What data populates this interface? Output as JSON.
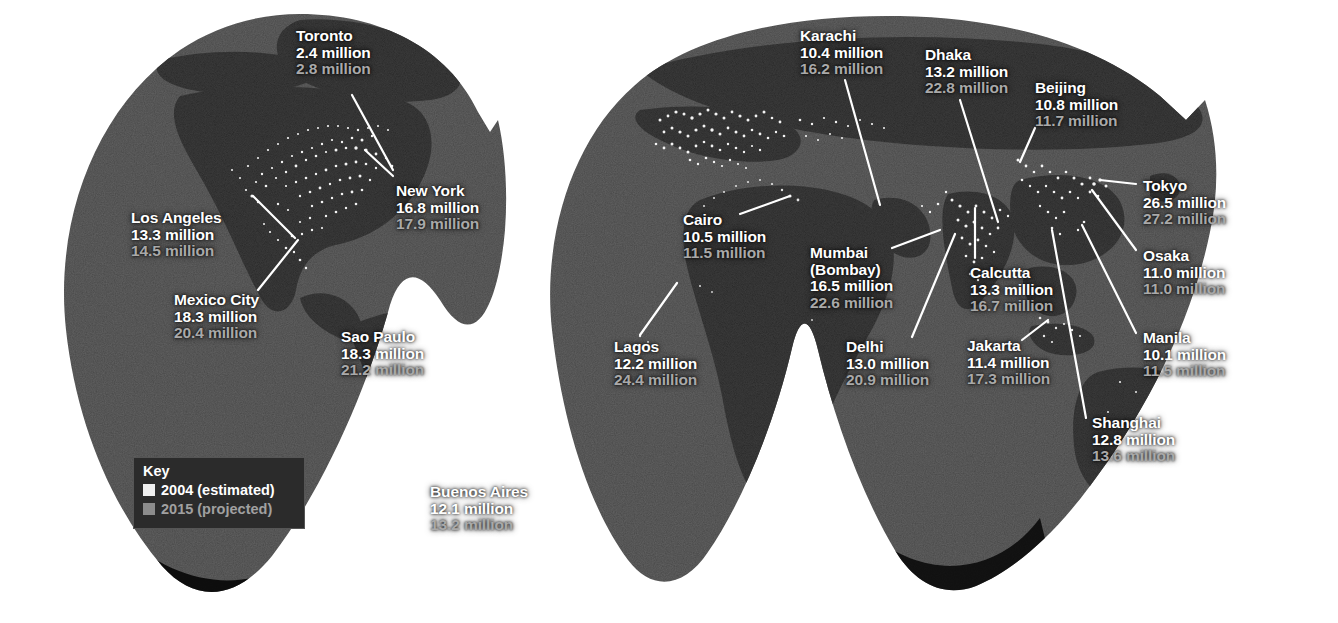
{
  "map": {
    "title": "World megacities night-lights map",
    "projection": "interrupted Goode homolosine",
    "ocean_color": "#262626",
    "land_color": "#0d0d0d",
    "light_color": "#ffffff",
    "background_color": "#ffffff",
    "leader_line_color": "#ffffff"
  },
  "key": {
    "title": "Key",
    "items": [
      {
        "label": "2004 (estimated)",
        "color": "#efefef",
        "text_color": "#ffffff"
      },
      {
        "label": "2015 (projected)",
        "color": "#8c8c8c",
        "text_color": "#a0a0a0"
      }
    ]
  },
  "units": "million",
  "chart_data": {
    "type": "map",
    "value_unit": "million",
    "series": [
      {
        "name": "2004 (estimated)",
        "color": "#ffffff"
      },
      {
        "name": "2015 (projected)",
        "color": "#a9a9a9"
      }
    ],
    "categories": [
      "Toronto",
      "New York",
      "Los Angeles",
      "Mexico City",
      "Sao Paulo",
      "Buenos Aires",
      "Lagos",
      "Cairo",
      "Karachi",
      "Mumbai (Bombay)",
      "Delhi",
      "Dhaka",
      "Calcutta",
      "Beijing",
      "Tokyo",
      "Osaka",
      "Manila",
      "Jakarta",
      "Shanghai"
    ],
    "values_2004": [
      2.4,
      16.8,
      13.3,
      18.3,
      18.3,
      12.1,
      12.2,
      10.5,
      10.4,
      16.5,
      13.0,
      13.2,
      13.3,
      10.8,
      26.5,
      11.0,
      10.1,
      11.4,
      12.8
    ],
    "values_2015": [
      2.8,
      17.9,
      14.5,
      20.4,
      21.2,
      13.2,
      24.4,
      11.5,
      16.2,
      22.6,
      20.9,
      22.8,
      16.7,
      11.7,
      27.2,
      11.0,
      11.5,
      17.3,
      13.6
    ]
  },
  "cities": [
    {
      "id": "toronto",
      "name": "Toronto",
      "name2": "",
      "v1": "2.4 million",
      "v2": "2.8 million",
      "x": 296,
      "y": 28,
      "align": "left"
    },
    {
      "id": "new-york",
      "name": "New York",
      "name2": "",
      "v1": "16.8 million",
      "v2": "17.9 million",
      "x": 396,
      "y": 183,
      "align": "left"
    },
    {
      "id": "los-angeles",
      "name": "Los Angeles",
      "name2": "",
      "v1": "13.3 million",
      "v2": "14.5 million",
      "x": 131,
      "y": 210,
      "align": "left"
    },
    {
      "id": "mexico-city",
      "name": "Mexico City",
      "name2": "",
      "v1": "18.3 million",
      "v2": "20.4 million",
      "x": 174,
      "y": 292,
      "align": "left"
    },
    {
      "id": "sao-paulo",
      "name": "Sao Paulo",
      "name2": "",
      "v1": "18.3 million",
      "v2": "21.2 million",
      "x": 341,
      "y": 329,
      "align": "left"
    },
    {
      "id": "buenos-aires",
      "name": "Buenos Aires",
      "name2": "",
      "v1": "12.1 million",
      "v2": "13.2 million",
      "x": 430,
      "y": 484,
      "align": "left"
    },
    {
      "id": "lagos",
      "name": "Lagos",
      "name2": "",
      "v1": "12.2 million",
      "v2": "24.4 million",
      "x": 614,
      "y": 339,
      "align": "left"
    },
    {
      "id": "cairo",
      "name": "Cairo",
      "name2": "",
      "v1": "10.5 million",
      "v2": "11.5 million",
      "x": 683,
      "y": 212,
      "align": "left"
    },
    {
      "id": "karachi",
      "name": "Karachi",
      "name2": "",
      "v1": "10.4 million",
      "v2": "16.2 million",
      "x": 800,
      "y": 28,
      "align": "left"
    },
    {
      "id": "mumbai",
      "name": "Mumbai",
      "name2": "(Bombay)",
      "v1": "16.5 million",
      "v2": "22.6 million",
      "x": 810,
      "y": 245,
      "align": "left"
    },
    {
      "id": "delhi",
      "name": "Delhi",
      "name2": "",
      "v1": "13.0 million",
      "v2": "20.9 million",
      "x": 846,
      "y": 339,
      "align": "left"
    },
    {
      "id": "dhaka",
      "name": "Dhaka",
      "name2": "",
      "v1": "13.2 million",
      "v2": "22.8 million",
      "x": 925,
      "y": 47,
      "align": "left"
    },
    {
      "id": "calcutta",
      "name": "Calcutta",
      "name2": "",
      "v1": "13.3 million",
      "v2": "16.7 million",
      "x": 970,
      "y": 265,
      "align": "left"
    },
    {
      "id": "beijing",
      "name": "Beijing",
      "name2": "",
      "v1": "10.8 million",
      "v2": "11.7 million",
      "x": 1035,
      "y": 80,
      "align": "left"
    },
    {
      "id": "tokyo",
      "name": "Tokyo",
      "name2": "",
      "v1": "26.5 million",
      "v2": "27.2 million",
      "x": 1143,
      "y": 178,
      "align": "left"
    },
    {
      "id": "osaka",
      "name": "Osaka",
      "name2": "",
      "v1": "11.0 million",
      "v2": "11.0 million",
      "x": 1143,
      "y": 248,
      "align": "left"
    },
    {
      "id": "manila",
      "name": "Manila",
      "name2": "",
      "v1": "10.1 million",
      "v2": "11.5 million",
      "x": 1143,
      "y": 330,
      "align": "left"
    },
    {
      "id": "jakarta",
      "name": "Jakarta",
      "name2": "",
      "v1": "11.4 million",
      "v2": "17.3 million",
      "x": 967,
      "y": 338,
      "align": "left"
    },
    {
      "id": "shanghai",
      "name": "Shanghai",
      "name2": "",
      "v1": "12.8 million",
      "v2": "13.6 million",
      "x": 1092,
      "y": 415,
      "align": "left"
    }
  ],
  "leader_lines": [
    {
      "id": "toronto",
      "x1": 352,
      "y1": 95,
      "x2": 393,
      "y2": 170
    },
    {
      "id": "new-york",
      "x1": 393,
      "y1": 176,
      "x2": 365,
      "y2": 150
    },
    {
      "id": "los-angeles",
      "x1": 253,
      "y1": 196,
      "x2": 295,
      "y2": 238
    },
    {
      "id": "mexico-city",
      "x1": 298,
      "y1": 240,
      "x2": 258,
      "y2": 290
    },
    {
      "id": "sao-paulo",
      "x1": 424,
      "y1": 340,
      "x2": 495,
      "y2": 392
    },
    {
      "id": "buenos-aires",
      "x1": 456,
      "y1": 420,
      "x2": 437,
      "y2": 478
    },
    {
      "id": "lagos",
      "x1": 677,
      "y1": 283,
      "x2": 640,
      "y2": 335
    },
    {
      "id": "cairo",
      "x1": 740,
      "y1": 214,
      "x2": 790,
      "y2": 196
    },
    {
      "id": "karachi",
      "x1": 845,
      "y1": 80,
      "x2": 880,
      "y2": 205
    },
    {
      "id": "mumbai",
      "x1": 892,
      "y1": 248,
      "x2": 940,
      "y2": 230
    },
    {
      "id": "delhi",
      "x1": 912,
      "y1": 337,
      "x2": 955,
      "y2": 234
    },
    {
      "id": "dhaka",
      "x1": 960,
      "y1": 100,
      "x2": 998,
      "y2": 222
    },
    {
      "id": "calcutta",
      "x1": 975,
      "y1": 258,
      "x2": 975,
      "y2": 208
    },
    {
      "id": "beijing",
      "x1": 1035,
      "y1": 128,
      "x2": 1020,
      "y2": 162
    },
    {
      "id": "tokyo",
      "x1": 1136,
      "y1": 184,
      "x2": 1100,
      "y2": 180
    },
    {
      "id": "osaka",
      "x1": 1136,
      "y1": 250,
      "x2": 1092,
      "y2": 190
    },
    {
      "id": "manila",
      "x1": 1136,
      "y1": 333,
      "x2": 1082,
      "y2": 225
    },
    {
      "id": "jakarta",
      "x1": 1022,
      "y1": 340,
      "x2": 1048,
      "y2": 320
    },
    {
      "id": "shanghai",
      "x1": 1086,
      "y1": 418,
      "x2": 1052,
      "y2": 230
    }
  ]
}
